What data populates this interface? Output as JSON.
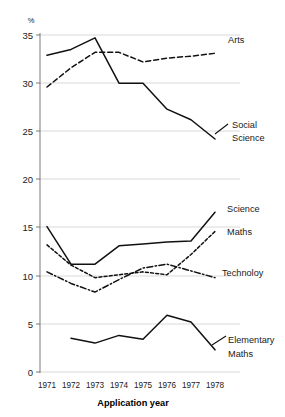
{
  "chart_data": {
    "type": "line",
    "title": "",
    "xlabel": "Application year",
    "ylabel": "%",
    "ylim": [
      0,
      36
    ],
    "xlim": [
      1971,
      1978
    ],
    "grid": true,
    "legend_position": "right-inline-labels",
    "categories": [
      1971,
      1972,
      1973,
      1974,
      1975,
      1976,
      1977,
      1978
    ],
    "x_tick_labels": [
      "1971",
      "1972",
      "1973",
      "1974",
      "1975",
      "1976",
      "1977",
      "1978"
    ],
    "y_tick_labels": [
      "0",
      "5",
      "10",
      "15",
      "20",
      "25",
      "30",
      "35"
    ],
    "y_ticks": [
      0,
      5,
      10,
      15,
      20,
      25,
      30,
      35
    ],
    "series": [
      {
        "name": "Arts",
        "style": "dashed",
        "values": [
          29.6,
          31.6,
          33.2,
          33.2,
          32.2,
          32.6,
          32.8,
          33.1
        ]
      },
      {
        "name": "Social Science",
        "style": "solid",
        "values": [
          32.9,
          33.5,
          34.7,
          30.0,
          30.0,
          27.3,
          26.2,
          24.2
        ]
      },
      {
        "name": "Science",
        "style": "solid",
        "values": [
          15.1,
          11.2,
          11.2,
          13.1,
          13.3,
          13.5,
          13.6,
          16.6
        ]
      },
      {
        "name": "Maths",
        "style": "dashed-fine",
        "values": [
          13.2,
          11.1,
          9.8,
          10.1,
          10.4,
          10.1,
          12.2,
          14.6
        ]
      },
      {
        "name": "Technoloy",
        "style": "dash-dot",
        "values": [
          10.4,
          9.2,
          8.3,
          9.6,
          10.8,
          11.2,
          10.5,
          9.8
        ]
      },
      {
        "name": "Elementary Maths",
        "style": "solid",
        "values": [
          null,
          3.5,
          3.0,
          3.8,
          3.4,
          5.9,
          5.2,
          2.3
        ]
      }
    ],
    "series_labels": [
      {
        "name": "Arts",
        "text": "Arts"
      },
      {
        "name": "Social Science",
        "text": "Social"
      },
      {
        "name": "Social Science 2",
        "text": "Science"
      },
      {
        "name": "Science",
        "text": "Science"
      },
      {
        "name": "Maths",
        "text": "Maths"
      },
      {
        "name": "Technoloy",
        "text": "Technoloy"
      },
      {
        "name": "Elementary Maths",
        "text": "Elementary"
      },
      {
        "name": "Elementary Maths 2",
        "text": "Maths"
      }
    ],
    "colors": {
      "line": "#111111",
      "grid": "#c9c9c9",
      "axis": "#6b6b6b",
      "text": "#1a1a1a",
      "background": "#ffffff"
    }
  },
  "axis": {
    "y_unit": "%",
    "x_title": "Application year"
  },
  "labels": {
    "arts": "Arts",
    "social": "Social",
    "social2": "Science",
    "science": "Science",
    "maths": "Maths",
    "technology": "Technoloy",
    "elementary": "Elementary",
    "elementary2": "Maths"
  }
}
